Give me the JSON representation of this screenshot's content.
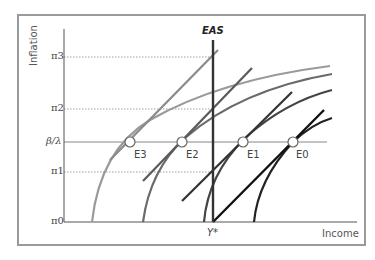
{
  "diagram": {
    "type": "economic-diagram",
    "y_axis": {
      "label": "Inflation",
      "ticks": [
        "π3",
        "π2",
        "β/λ",
        "π1",
        "π0"
      ]
    },
    "x_axis": {
      "label": "Income",
      "ticks": [
        "Y*"
      ]
    },
    "vertical_line": {
      "label": "EAS"
    },
    "equilibria": [
      "E3",
      "E2",
      "E1",
      "E0"
    ],
    "colors": {
      "frame": "#9a9a9a",
      "axis": "#555555",
      "guide_dotted": "#888888",
      "horizontal_line": "#888888",
      "eas": "#333333",
      "curve_e0": "#111111",
      "curve_e1": "#444444",
      "curve_e2": "#6a6a6a",
      "curve_e3": "#9a9a9a"
    }
  }
}
